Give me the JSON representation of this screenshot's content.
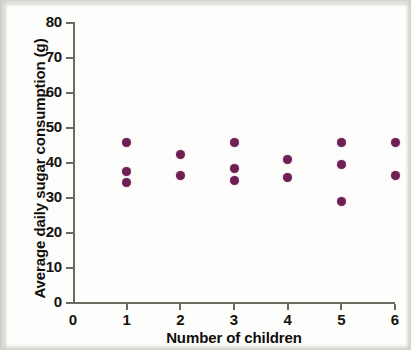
{
  "figure": {
    "background_color": "#fdfdfb",
    "axis_color": "#6f6a61",
    "marker_color": "#6e2054"
  },
  "chart_data": {
    "type": "scatter",
    "title": "",
    "xlabel": "Number of children",
    "ylabel": "Average daily sugar consumption (g)",
    "xlim": [
      0,
      6
    ],
    "ylim": [
      0,
      80
    ],
    "xticks": [
      "0",
      "1",
      "2",
      "3",
      "4",
      "5",
      "6"
    ],
    "yticks": [
      "0",
      "10",
      "20",
      "30",
      "40",
      "50",
      "60",
      "70",
      "80"
    ],
    "grid": false,
    "legend": null,
    "marker_color": "#6e2054",
    "points": [
      {
        "x": 1,
        "y": 46
      },
      {
        "x": 1,
        "y": 37.5
      },
      {
        "x": 1,
        "y": 34.3
      },
      {
        "x": 2,
        "y": 42.5
      },
      {
        "x": 2,
        "y": 36.5
      },
      {
        "x": 3,
        "y": 46
      },
      {
        "x": 3,
        "y": 38.5
      },
      {
        "x": 3,
        "y": 35
      },
      {
        "x": 4,
        "y": 41
      },
      {
        "x": 4,
        "y": 36
      },
      {
        "x": 5,
        "y": 46
      },
      {
        "x": 5,
        "y": 39.5
      },
      {
        "x": 5,
        "y": 29
      },
      {
        "x": 6,
        "y": 46
      },
      {
        "x": 6,
        "y": 36.3
      }
    ]
  }
}
